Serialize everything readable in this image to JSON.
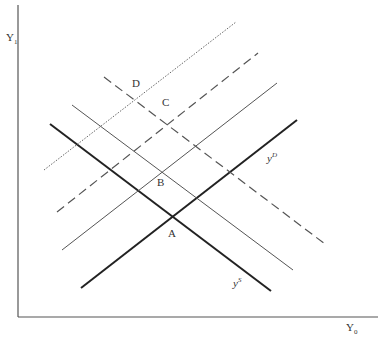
{
  "diagram": {
    "axes": {
      "y_label": "Y",
      "y_label_sub": "1",
      "x_label": "Y",
      "x_label_sub": "0"
    },
    "points": {
      "A": "A",
      "B": "B",
      "C": "C",
      "D": "D"
    },
    "curves": {
      "supply_label": "y",
      "supply_sup": "S",
      "demand_label": "y",
      "demand_sup": "D"
    },
    "colors": {
      "axis": "#555555",
      "thick": "#222222",
      "thin": "#555555",
      "dashed": "#555555",
      "dotted": "#666666"
    }
  }
}
